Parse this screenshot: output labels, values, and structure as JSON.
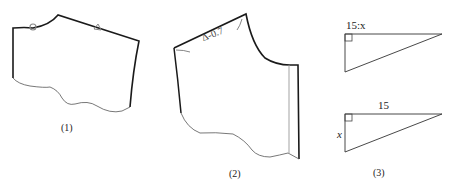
{
  "figures": [
    {
      "id": "1",
      "caption": "(1)",
      "markers": [
        "circle-notch-marker",
        "triangle-notch-marker"
      ]
    },
    {
      "id": "2",
      "caption": "(2)",
      "annotation": "Δ-0.7"
    },
    {
      "id": "3",
      "caption": "(3)",
      "triangle_top": {
        "label_top": "15:x"
      },
      "triangle_bottom": {
        "label_top": "15",
        "label_left": "x"
      }
    }
  ],
  "colors": {
    "outline_bold": "#1a1a1a",
    "outline_thin": "#555555",
    "marker": "#888888"
  }
}
